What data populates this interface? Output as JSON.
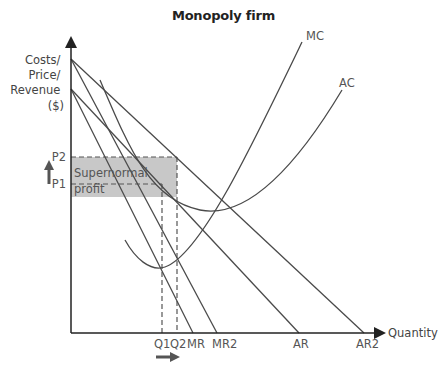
{
  "title": "Monopoly firm",
  "axes": {
    "y_label_lines": [
      "Costs/",
      "Price/",
      "Revenue",
      "($)"
    ],
    "x_label": "Quantity"
  },
  "price_labels": {
    "p2": "P2",
    "p1": "P1"
  },
  "quantity_labels": {
    "q1": "Q1",
    "q2": "Q2"
  },
  "curve_labels": {
    "mc": "MC",
    "ac": "AC",
    "mr": "MR",
    "mr2": "MR2",
    "ar": "AR",
    "ar2": "AR2"
  },
  "shaded_area": {
    "label_line1": "Supernormal",
    "label_line2": "profit",
    "color": "#c8c8c8"
  },
  "arrows": {
    "price_increase": "up-arrow",
    "quantity_increase": "right-arrow"
  },
  "colors": {
    "curve": "#4a4a4a",
    "label": "#555555",
    "shade": "#c8c8c8"
  }
}
